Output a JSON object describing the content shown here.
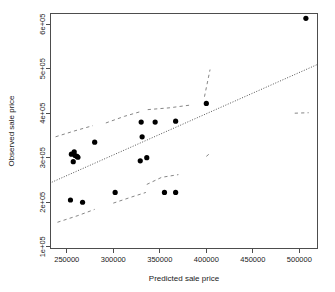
{
  "chart_data": {
    "type": "scatter",
    "title": "",
    "xlabel": "Predicted sale price",
    "ylabel": "Observed sale price",
    "xlim": [
      232000,
      520000
    ],
    "ylim": [
      95000,
      625000
    ],
    "grid": false,
    "legend": "none",
    "xticks": [
      250000,
      300000,
      350000,
      400000,
      450000,
      500000
    ],
    "xtick_labels": [
      "250000",
      "300000",
      "350000",
      "400000",
      "450000",
      "500000"
    ],
    "yticks": [
      100000,
      200000,
      300000,
      400000,
      500000,
      600000
    ],
    "ytick_labels": [
      "1e+05",
      "2e+05",
      "3e+05",
      "4e+05",
      "5e+05",
      "6e+05"
    ],
    "points": [
      {
        "x": 254000,
        "y": 205000
      },
      {
        "x": 267000,
        "y": 200000
      },
      {
        "x": 255000,
        "y": 308000
      },
      {
        "x": 258000,
        "y": 313000
      },
      {
        "x": 259000,
        "y": 305000
      },
      {
        "x": 261000,
        "y": 303000
      },
      {
        "x": 262000,
        "y": 301000
      },
      {
        "x": 257000,
        "y": 291000
      },
      {
        "x": 280000,
        "y": 335000
      },
      {
        "x": 302000,
        "y": 222000
      },
      {
        "x": 330000,
        "y": 380000
      },
      {
        "x": 331000,
        "y": 347000
      },
      {
        "x": 329000,
        "y": 293000
      },
      {
        "x": 336000,
        "y": 300000
      },
      {
        "x": 345000,
        "y": 380000
      },
      {
        "x": 355000,
        "y": 222000
      },
      {
        "x": 367000,
        "y": 222000
      },
      {
        "x": 367000,
        "y": 382000
      },
      {
        "x": 400000,
        "y": 422000
      },
      {
        "x": 507000,
        "y": 613000
      }
    ],
    "fit_line": {
      "label": "regression-fit",
      "style": "dotted",
      "x1": 234000,
      "y1": 245000,
      "x2": 520000,
      "y2": 510000
    },
    "confidence_bands": [
      {
        "label": "upper-band",
        "style": "dashed",
        "segments": [
          [
            [
              238000,
              347000
            ],
            [
              258000,
              360000
            ],
            [
              278000,
              372000
            ]
          ],
          [
            [
              292000,
              378000
            ],
            [
              312000,
              393000
            ],
            [
              330000,
              404000
            ]
          ],
          [
            [
              337000,
              408000
            ],
            [
              360000,
              412000
            ],
            [
              382000,
              418000
            ]
          ],
          [
            [
              398000,
              437000
            ],
            [
              404000,
              498000
            ]
          ],
          [
            [
              400000,
              303000
            ],
            [
              404000,
              310000
            ]
          ],
          [
            [
              495000,
              400000
            ],
            [
              510000,
              401000
            ]
          ]
        ]
      },
      {
        "label": "lower-band",
        "style": "dashed",
        "segments": [
          [
            [
              240000,
              155000
            ],
            [
              262000,
              170000
            ],
            [
              280000,
              184000
            ]
          ],
          [
            [
              300000,
              198000
            ],
            [
              320000,
              212000
            ],
            [
              335000,
              222000
            ]
          ],
          [
            [
              336000,
              240000
            ],
            [
              352000,
              256000
            ],
            [
              370000,
              262000
            ]
          ]
        ]
      }
    ]
  },
  "plot_geometry": {
    "frame_left": 50,
    "frame_right": 318,
    "frame_top": 13,
    "frame_bottom": 249,
    "point_radius": 2.6
  }
}
